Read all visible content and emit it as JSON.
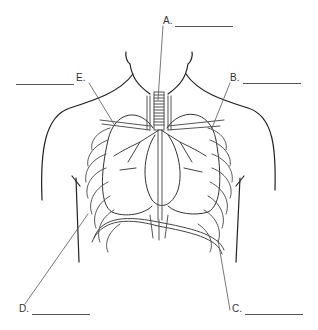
{
  "diagram": {
    "type": "anatomy-worksheet",
    "line_color": "#444444",
    "background": "#ffffff"
  },
  "labels": [
    {
      "id": "A",
      "text": "A.",
      "x": 163,
      "y": 21,
      "blank_x": 175,
      "blank_w": 58,
      "blank_y": 26
    },
    {
      "id": "B",
      "text": "B.",
      "x": 230,
      "y": 78,
      "blank_x": 243,
      "blank_w": 58,
      "blank_y": 83
    },
    {
      "id": "C",
      "text": "C.",
      "x": 232,
      "y": 309,
      "blank_x": 245,
      "blank_w": 58,
      "blank_y": 314
    },
    {
      "id": "D",
      "text": "D.",
      "x": 19,
      "y": 309,
      "blank_x": 32,
      "blank_w": 58,
      "blank_y": 314
    },
    {
      "id": "E",
      "text": "E.",
      "x": 76,
      "y": 78,
      "blank_x": 16,
      "blank_w": 58,
      "blank_y": 83
    }
  ]
}
